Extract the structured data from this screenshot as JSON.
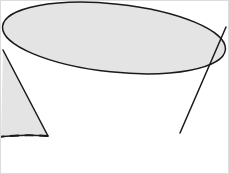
{
  "figure": {
    "title": "Frustum of a cone",
    "shape_name": "frustum",
    "background_color": "#ffffff",
    "surface_color": "#e4e4e4",
    "outline_color": "#1a1a1a",
    "hidden_line_color": "#1a1a1a",
    "frame_color": "#dcdcdc",
    "outline_width": 1.5,
    "hidden_line_width": 1.9,
    "hidden_line_dash": "9 5.5",
    "canvas": {
      "width": 229,
      "height": 174
    }
  },
  "geometry": {
    "top_ellipse": {
      "label": "top rim",
      "center_x": 114,
      "center_y": 38,
      "radius_x": 112,
      "radius_y": 34,
      "rotation_deg": 6,
      "visible": "full"
    },
    "bottom_ellipse": {
      "label": "base circle",
      "center_x": 114,
      "center_y": 135,
      "radius_x": 66,
      "radius_y": 19,
      "rotation_deg": -1,
      "front_arc": "solid",
      "back_arc": "dashed"
    },
    "left_wall": {
      "label": "left slant edge",
      "x1": 3,
      "y1": 50,
      "x2": 48,
      "y2": 136
    },
    "right_wall": {
      "label": "right slant edge",
      "x1": 226,
      "y1": 27,
      "x2": 180,
      "y2": 133
    },
    "body_path": "M 3,50 L 48,136 A 66,19 -1 0 0 180,133 L 226,27 A 112,34 6 0 1 3,50 Z"
  }
}
